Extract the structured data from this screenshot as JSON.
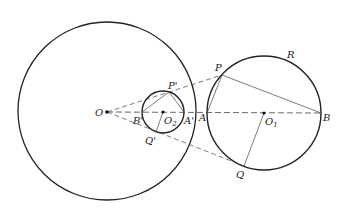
{
  "diagram": {
    "type": "geometry",
    "circles": [
      {
        "name": "big-circle",
        "center": "O",
        "cx": 107,
        "cy": 111,
        "r": 89
      },
      {
        "name": "small-circle",
        "center": "O2",
        "cx": 163,
        "cy": 112,
        "r": 21
      },
      {
        "name": "circle-R",
        "center": "O1",
        "cx": 264,
        "cy": 113,
        "r": 57,
        "label": "R"
      }
    ],
    "points": {
      "O": {
        "x": 107,
        "y": 112,
        "label": "O"
      },
      "O2": {
        "x": 163,
        "y": 112,
        "label": "O",
        "sub": "2"
      },
      "O1": {
        "x": 264,
        "y": 113,
        "label": "O",
        "sub": "1"
      },
      "P": {
        "x": 222,
        "y": 75,
        "label": "P"
      },
      "Q": {
        "x": 244,
        "y": 166,
        "label": "Q"
      },
      "A": {
        "x": 207,
        "y": 113,
        "label": "A"
      },
      "B": {
        "x": 321,
        "y": 113,
        "label": "B"
      },
      "P_prime": {
        "x": 169,
        "y": 92,
        "label": "P'"
      },
      "Q_prime": {
        "x": 156,
        "y": 132,
        "label": "Q'"
      },
      "A_prime": {
        "x": 184,
        "y": 112,
        "label": "A'"
      },
      "B_prime": {
        "x": 142,
        "y": 112,
        "label": "B'"
      },
      "R": {
        "label": "R"
      }
    },
    "segments": [
      "O-P (dashed)",
      "O-Q (dashed)",
      "O-B (dashed axis)",
      "P-A",
      "P-B",
      "O1-Q",
      "P'-B'",
      "P'-A'",
      "O2-Q'"
    ]
  }
}
